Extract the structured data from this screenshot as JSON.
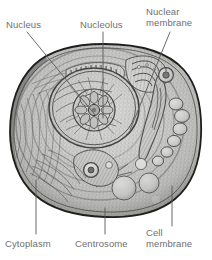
{
  "figure": {
    "style": "grayscale engraving / lithograph",
    "background_color": "#ffffff",
    "label_color": "#6f6f6f",
    "leader_color": "#5a5a5a",
    "labels": [
      {
        "id": "nucleus",
        "text": "Nucleus",
        "lines": [
          "Nucleus"
        ],
        "position": "top-left",
        "leader": "diagonal down-right"
      },
      {
        "id": "nucleolus",
        "text": "Nucleolus",
        "lines": [
          "Nucleolus"
        ],
        "position": "top-center",
        "leader": "vertical down"
      },
      {
        "id": "nuclear-membrane",
        "text": "Nuclear membrane",
        "lines": [
          "Nuclear",
          "membrane"
        ],
        "position": "top-right",
        "leader": "diagonal down-left"
      },
      {
        "id": "cytoplasm",
        "text": "Cytoplasm",
        "lines": [
          "Cytoplasm"
        ],
        "position": "bottom-left",
        "leader": "vertical up"
      },
      {
        "id": "centrosome",
        "text": "Centrosome",
        "lines": [
          "Centrosome"
        ],
        "position": "bottom-center",
        "leader": "vertical up"
      },
      {
        "id": "cell-membrane",
        "text": "Cell membrane",
        "lines": [
          "Cell",
          "membrane"
        ],
        "position": "bottom-right",
        "leader": "vertical up"
      }
    ],
    "structures": [
      "cell membrane",
      "cytoplasm",
      "nucleus",
      "nucleolus",
      "nuclear membrane",
      "centrosome",
      "vacuoles"
    ]
  }
}
